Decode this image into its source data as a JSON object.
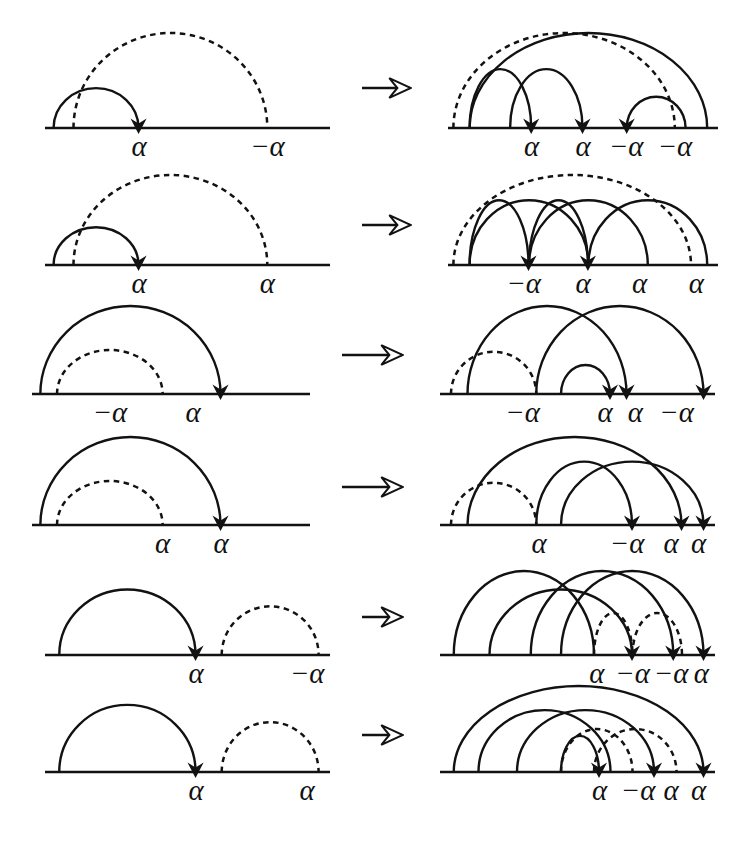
{
  "figure": {
    "rows": 6,
    "arrow_glyph": "→",
    "alpha": "α",
    "neg_alpha": "−α",
    "line_color": "#121212",
    "background": "#ffffff"
  },
  "chart_data": {
    "type": "diagram",
    "rows": [
      {
        "index": 1,
        "left": {
          "labels": [
            "α",
            "−α"
          ],
          "arcs": [
            {
              "style": "dashed",
              "from": 0.1,
              "to": 0.78,
              "arrow": false,
              "height": 1.0
            },
            {
              "style": "solid",
              "from": 0.03,
              "to": 0.33,
              "arrow": true,
              "height": 0.42
            }
          ],
          "label_positions": [
            0.33,
            0.78
          ]
        },
        "right": {
          "labels": [
            "α",
            "α",
            "−α",
            "−α"
          ],
          "arcs": [
            {
              "style": "dashed",
              "from": 0.02,
              "to": 0.84,
              "arrow": false,
              "height": 1.0
            },
            {
              "style": "solid",
              "from": 0.08,
              "to": 0.96,
              "arrow": false,
              "height": 1.0
            },
            {
              "style": "solid",
              "from": 0.08,
              "to": 0.31,
              "arrow": true,
              "height": 0.62
            },
            {
              "style": "solid",
              "from": 0.23,
              "to": 0.5,
              "arrow": true,
              "height": 0.62
            },
            {
              "style": "solid",
              "from": 0.88,
              "to": 0.66,
              "arrow": true,
              "height": 0.33
            }
          ],
          "label_positions": [
            0.31,
            0.5,
            0.66,
            0.84
          ]
        }
      },
      {
        "index": 2,
        "left": {
          "labels": [
            "α",
            "α"
          ],
          "arcs": [
            {
              "style": "dashed",
              "from": 0.1,
              "to": 0.78,
              "arrow": false,
              "height": 1.0
            },
            {
              "style": "solid",
              "from": 0.03,
              "to": 0.33,
              "arrow": true,
              "height": 0.42
            }
          ],
          "label_positions": [
            0.33,
            0.78
          ]
        },
        "right": {
          "labels": [
            "−α",
            "α",
            "α",
            "α"
          ],
          "arcs": [
            {
              "style": "dashed",
              "from": 0.02,
              "to": 0.9,
              "arrow": false,
              "height": 1.0
            },
            {
              "style": "solid",
              "from": 0.08,
              "to": 0.52,
              "arrow": false,
              "height": 0.72
            },
            {
              "style": "solid",
              "from": 0.3,
              "to": 0.74,
              "arrow": false,
              "height": 0.72
            },
            {
              "style": "solid",
              "from": 0.52,
              "to": 0.96,
              "arrow": false,
              "height": 0.72
            },
            {
              "style": "solid",
              "from": 0.08,
              "to": 0.3,
              "arrow": true,
              "height": 0.72
            },
            {
              "style": "solid",
              "from": 0.3,
              "to": 0.52,
              "arrow": true,
              "height": 0.72
            }
          ],
          "label_positions": [
            0.28,
            0.5,
            0.71,
            0.92
          ]
        }
      },
      {
        "index": 3,
        "left": {
          "labels": [
            "−α",
            "α"
          ],
          "arcs": [
            {
              "style": "solid",
              "from": 0.03,
              "to": 0.68,
              "arrow": true,
              "height": 1.0
            },
            {
              "style": "dashed",
              "from": 0.09,
              "to": 0.47,
              "arrow": false,
              "height": 0.5
            }
          ],
          "label_positions": [
            0.28,
            0.58
          ]
        },
        "right": {
          "labels": [
            "−α",
            "α",
            "α",
            "−α"
          ],
          "arcs": [
            {
              "style": "dashed",
              "from": 0.04,
              "to": 0.35,
              "arrow": false,
              "height": 0.48
            },
            {
              "style": "solid",
              "from": 0.1,
              "to": 0.68,
              "arrow": true,
              "height": 1.0
            },
            {
              "style": "solid",
              "from": 0.35,
              "to": 0.96,
              "arrow": true,
              "height": 1.0
            },
            {
              "style": "solid",
              "from": 0.44,
              "to": 0.62,
              "arrow": true,
              "height": 0.33
            }
          ],
          "label_positions": [
            0.3,
            0.6,
            0.71,
            0.86
          ]
        }
      },
      {
        "index": 4,
        "left": {
          "labels": [
            "α",
            "α"
          ],
          "arcs": [
            {
              "style": "solid",
              "from": 0.03,
              "to": 0.68,
              "arrow": true,
              "height": 1.0
            },
            {
              "style": "dashed",
              "from": 0.09,
              "to": 0.47,
              "arrow": false,
              "height": 0.5
            }
          ],
          "label_positions": [
            0.47,
            0.68
          ]
        },
        "right": {
          "labels": [
            "α",
            "−α",
            "α",
            "α"
          ],
          "arcs": [
            {
              "style": "dashed",
              "from": 0.04,
              "to": 0.35,
              "arrow": false,
              "height": 0.48
            },
            {
              "style": "solid",
              "from": 0.1,
              "to": 0.88,
              "arrow": true,
              "height": 1.0
            },
            {
              "style": "solid",
              "from": 0.35,
              "to": 0.7,
              "arrow": true,
              "height": 0.72
            },
            {
              "style": "solid",
              "from": 0.44,
              "to": 0.96,
              "arrow": true,
              "height": 0.72
            }
          ],
          "label_positions": [
            0.36,
            0.68,
            0.84,
            0.94
          ]
        }
      },
      {
        "index": 5,
        "left": {
          "labels": [
            "α",
            "−α"
          ],
          "arcs": [
            {
              "style": "solid",
              "from": 0.05,
              "to": 0.53,
              "arrow": true,
              "height": 0.78
            },
            {
              "style": "dashed",
              "from": 0.62,
              "to": 0.96,
              "arrow": false,
              "height": 0.58
            }
          ],
          "label_positions": [
            0.53,
            0.92
          ]
        },
        "right": {
          "labels": [
            "α",
            "−α",
            "−α",
            "α"
          ],
          "arcs": [
            {
              "style": "solid",
              "from": 0.05,
              "to": 0.56,
              "arrow": false,
              "height": 1.0
            },
            {
              "style": "solid",
              "from": 0.18,
              "to": 0.7,
              "arrow": true,
              "height": 0.78
            },
            {
              "style": "solid",
              "from": 0.33,
              "to": 0.85,
              "arrow": true,
              "height": 1.0
            },
            {
              "style": "solid",
              "from": 0.44,
              "to": 0.96,
              "arrow": true,
              "height": 1.0
            },
            {
              "style": "dashed",
              "from": 0.56,
              "to": 0.7,
              "arrow": false,
              "height": 0.5
            },
            {
              "style": "dashed",
              "from": 0.7,
              "to": 0.88,
              "arrow": false,
              "height": 0.5
            }
          ],
          "label_positions": [
            0.57,
            0.7,
            0.84,
            0.95
          ]
        }
      },
      {
        "index": 6,
        "left": {
          "labels": [
            "α",
            "α"
          ],
          "arcs": [
            {
              "style": "solid",
              "from": 0.05,
              "to": 0.53,
              "arrow": true,
              "height": 0.78
            },
            {
              "style": "dashed",
              "from": 0.62,
              "to": 0.96,
              "arrow": false,
              "height": 0.58
            }
          ],
          "label_positions": [
            0.53,
            0.92
          ]
        },
        "right": {
          "labels": [
            "α",
            "−α",
            "α",
            "α"
          ],
          "arcs": [
            {
              "style": "solid",
              "from": 0.05,
              "to": 0.96,
              "arrow": true,
              "height": 1.0
            },
            {
              "style": "solid",
              "from": 0.14,
              "to": 0.62,
              "arrow": false,
              "height": 0.72
            },
            {
              "style": "solid",
              "from": 0.28,
              "to": 0.78,
              "arrow": true,
              "height": 0.72
            },
            {
              "style": "dashed",
              "from": 0.44,
              "to": 0.7,
              "arrow": false,
              "height": 0.5
            },
            {
              "style": "dashed",
              "from": 0.56,
              "to": 0.86,
              "arrow": false,
              "height": 0.5
            },
            {
              "style": "solid",
              "from": 0.44,
              "to": 0.58,
              "arrow": true,
              "height": 0.42
            }
          ],
          "label_positions": [
            0.58,
            0.72,
            0.84,
            0.94
          ]
        }
      }
    ]
  },
  "background_text": {
    "visible": true,
    "note": "faint show-through of printed text from the reverse side of the page"
  }
}
